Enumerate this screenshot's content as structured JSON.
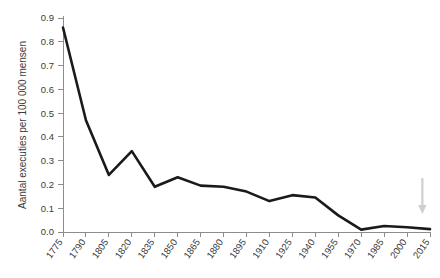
{
  "chart_data": {
    "type": "line",
    "title": "",
    "subtitle": "",
    "xlabel": "",
    "ylabel": "Aantal executies per 100 000 mensen",
    "xlim": [
      1775,
      2015
    ],
    "ylim": [
      0.0,
      0.9
    ],
    "grid": false,
    "legend": null,
    "legend_position": "none",
    "x_tick_labels": [
      "1775",
      "1790",
      "1805",
      "1820",
      "1835",
      "1850",
      "1865",
      "1880",
      "1895",
      "1910",
      "1925",
      "1940",
      "1955",
      "1970",
      "1985",
      "2000",
      "2015"
    ],
    "y_tick_labels": [
      "0.0",
      "0.1",
      "0.2",
      "0.3",
      "0.4",
      "0.5",
      "0.6",
      "0.7",
      "0.8",
      "0.9"
    ],
    "y_tick_values": [
      0.0,
      0.1,
      0.2,
      0.3,
      0.4,
      0.5,
      0.6,
      0.7,
      0.8,
      0.9
    ],
    "x": [
      1775,
      1790,
      1805,
      1820,
      1835,
      1850,
      1865,
      1880,
      1895,
      1910,
      1925,
      1940,
      1955,
      1970,
      1985,
      2000,
      2015
    ],
    "values": [
      0.86,
      0.47,
      0.24,
      0.34,
      0.19,
      0.23,
      0.195,
      0.19,
      0.17,
      0.13,
      0.155,
      0.145,
      0.07,
      0.01,
      0.025,
      0.02,
      0.012
    ],
    "series": [
      {
        "name": "Aantal executies per 100 000 mensen",
        "color": "#1a1a1a",
        "values": [
          0.86,
          0.47,
          0.24,
          0.34,
          0.19,
          0.23,
          0.195,
          0.19,
          0.17,
          0.13,
          0.155,
          0.145,
          0.07,
          0.01,
          0.025,
          0.02,
          0.012
        ]
      }
    ],
    "annotations": [
      {
        "type": "arrow",
        "direction": "down",
        "x": 2010,
        "color": "#cfcfcf",
        "label": ""
      }
    ],
    "colors": {
      "line": "#1a1a1a",
      "axis": "#8c8c8c",
      "text": "#3a3a3a",
      "arrow": "#cfcfcf",
      "background": "#ffffff"
    }
  }
}
